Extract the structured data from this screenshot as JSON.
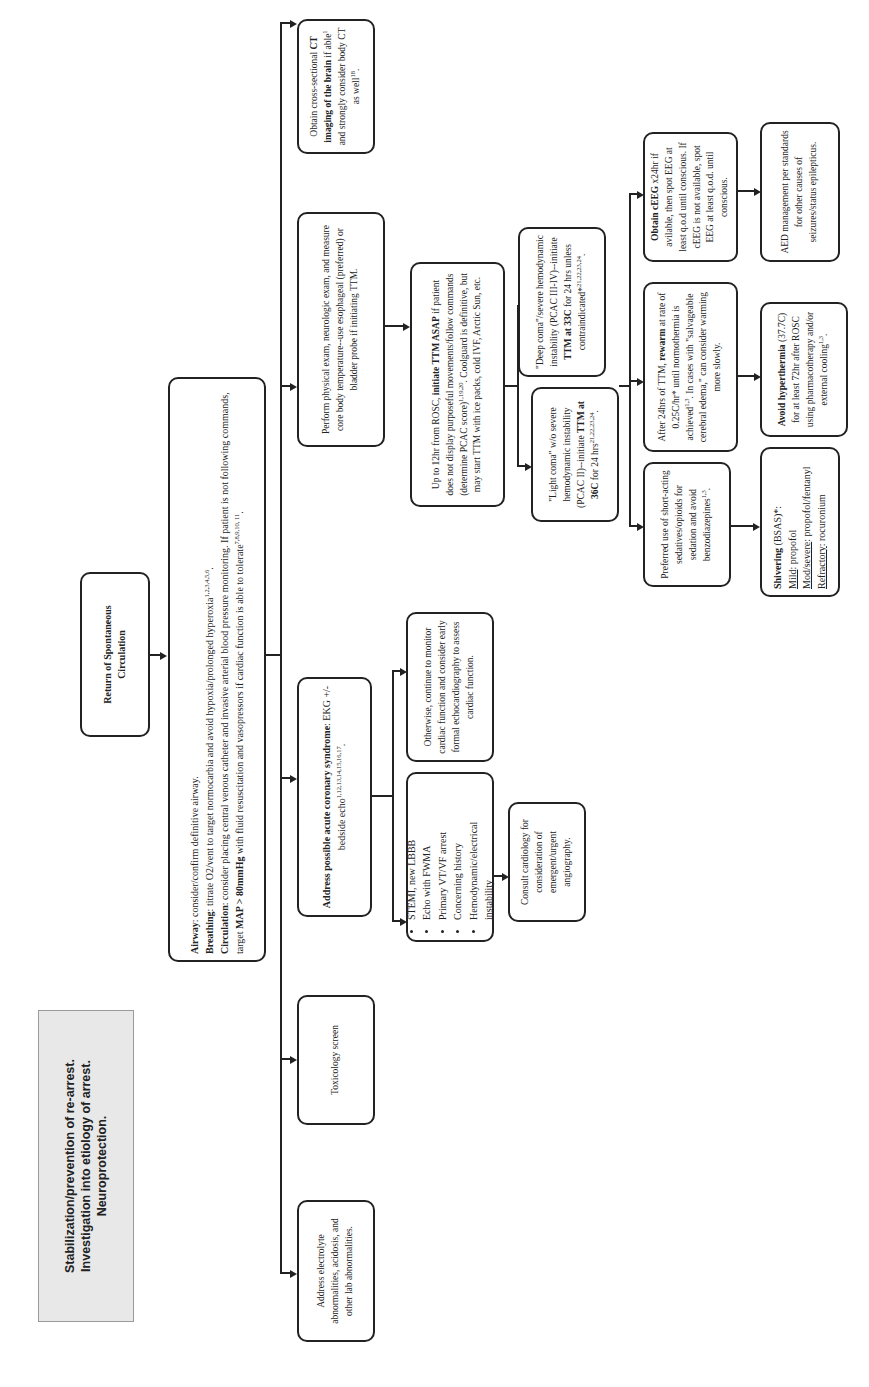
{
  "header": {
    "line1": "Stabilization/prevention of re-arrest.",
    "line2": "Investigation into etiology of arrest.",
    "line3": "Neuroprotection."
  },
  "root": {
    "label": "Return of Spontaneous Circulation"
  },
  "abc": {
    "airway_label": "Airway",
    "airway_text": ": consider/confirm definitive airway.",
    "breathing_label": "Breathing",
    "breathing_text": ": titrate O2/vent to target normocarbia and avoid hypoxia/prolonged hyperoxia",
    "breathing_refs": "1,2,3,4,5,6",
    "circulation_label": "Circulation",
    "circulation_text": ": consider placing central venous catheter and invasive arterial blood pressure monitoring. If patient is not following commands, target ",
    "map_label": "MAP > 80mmHg",
    "circulation_text2": " with fluid resuscitation and vasopressors if cardiac function is able to tolerate",
    "circulation_refs": "7,8,9,10, 11"
  },
  "branches": {
    "electrolyte": "Address electrolyte abnormalities, acidosis, and other lab abnormalities.",
    "toxicology": "Toxicology screen",
    "acs": {
      "bold": "Address possible acute coronary syndrome",
      "text": ": EKG +/- bedside echo",
      "refs": "1,12,13,14,15,16,17"
    },
    "exam": "Perform physical exam, neurologic exam, and measure core body temperature--use esophageal (preferred) or bladder probe if initiating TTM.",
    "ct": {
      "text1": "Obtain cross-sectional ",
      "bold": "CT imaging of the brain",
      "text2": " if able",
      "ref1": "1",
      "text3": " and strongly consider body CT as well",
      "ref2": "18"
    }
  },
  "acs_children": {
    "indications": [
      "STEMI, new LBBB",
      "Echo with FWMA",
      "Primary VT/VF arrest",
      "Concerning history",
      "Hemodynamic/electrical instability"
    ],
    "consult": "Consult cardiology for consideration of emergent/urgent angiography.",
    "otherwise": "Otherwise, continue to monitor cardiac function and consider early formal echocardiography to assess cardiac function."
  },
  "ttm": {
    "text1": "Up to 12hr from ROSC, ",
    "bold": "initiate TTM ASAP",
    "text2": " if patient does not display purposeful movements/follow commands (determine PCAC score)",
    "refs": "1,19,20",
    "text3": ". Coolguard is definitive, but may start TTM with ice packs, cold IVF, Arctic Sun, etc.",
    "light": {
      "text1": "\"Light coma\" w/o severe hemodynamic instability (PCAC II)--initiate ",
      "bold": "TTM at 36C",
      "text2": " for 24 hrs",
      "refs": "21,22,23,24"
    },
    "deep": {
      "text1": "\"Deep coma\"/severe hemodynamic instability (PCAC III-IV)--initiate ",
      "bold": "TTM at 33C",
      "text2": " for 24 hrs unless contraindicated*",
      "refs": "21,22,23,24"
    }
  },
  "management": {
    "sedation": {
      "text": "Preferred use of short-acting sedatives/opioids for sedation and avoid benzodiazepines",
      "refs": "1,3"
    },
    "rewarm": {
      "text1": "After 24hrs of TTM, ",
      "bold": "rewarm",
      "text2": " at rate of 0.25C/hr* until normothermia is achieved",
      "refs": "1,3",
      "text3": ". In cases with \"salvageable cerebral edema,\" can consider warming more slowly."
    },
    "eeg": {
      "bold": "Obtain cEEG",
      "text": " x24hr if avilable, then spot EEG at least q.o.d until conscious. If cEEG is not available, spot EEG at least q.o.d. until conscious."
    },
    "shivering": {
      "bold": "Shivering",
      "text": " (BSAS)*:",
      "mild_label": "Mild",
      "mild_text": ": propofol",
      "mod_label": "Mod/severe",
      "mod_text": ": propofol/fentanyl",
      "refr_label": "Refractory",
      "refr_text": ": rocuronium"
    },
    "hyperthermia": {
      "bold": "Avoid hyperthermia",
      "text": " (37.7C) for at least 72hr after ROSC using pharmacotherapy and/or external cooling",
      "refs": "1,3"
    },
    "aed": "AED management per standards for other causes of seizures/status epilepticus."
  }
}
